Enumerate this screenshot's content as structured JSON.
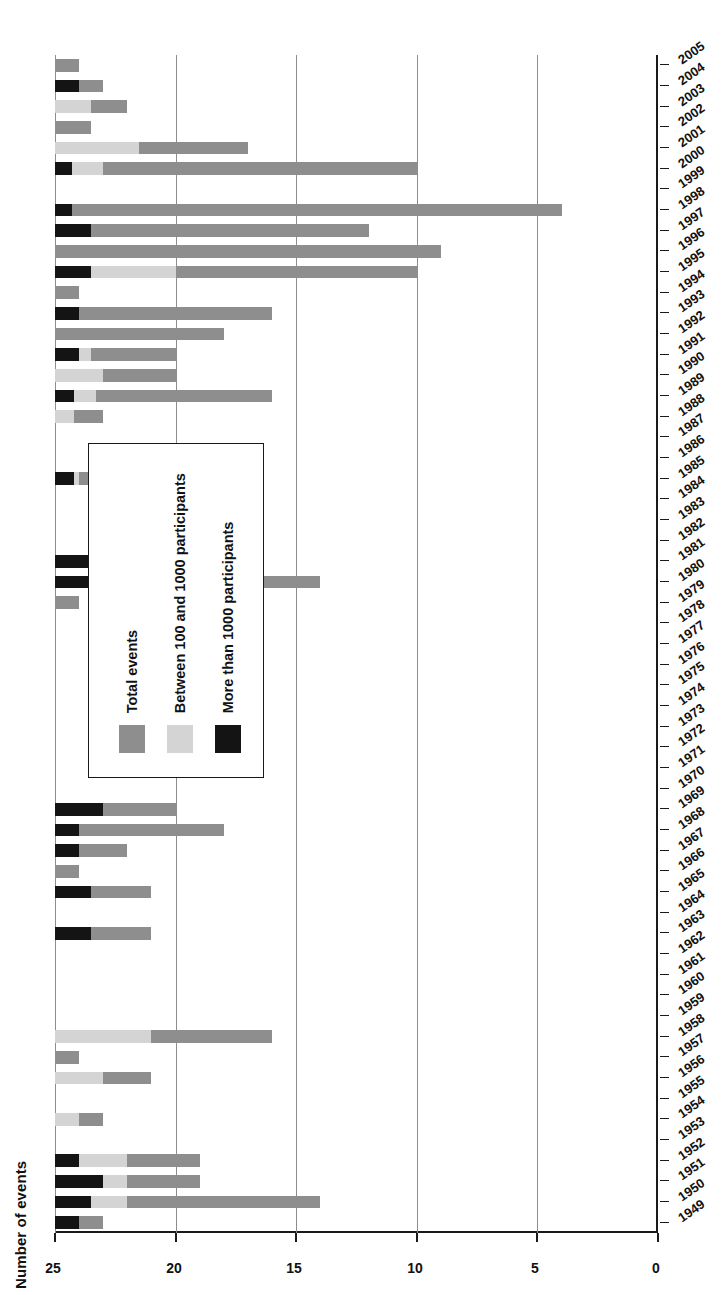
{
  "chart_data": {
    "type": "bar",
    "orientation": "horizontal-rotated",
    "title": "",
    "xlabel": "",
    "ylabel": "Number of events",
    "ylim": [
      0,
      25
    ],
    "ytick_labels": [
      "0",
      "5",
      "10",
      "15",
      "20",
      "25"
    ],
    "ytick_values": [
      0,
      5,
      10,
      15,
      20,
      25
    ],
    "grid": true,
    "legend_position": "inside-left",
    "categories": [
      "1949",
      "1950",
      "1951",
      "1952",
      "1953",
      "1954",
      "1955",
      "1956",
      "1957",
      "1958",
      "1959",
      "1960",
      "1961",
      "1962",
      "1963",
      "1964",
      "1965",
      "1966",
      "1967",
      "1968",
      "1969",
      "1970",
      "1971",
      "1972",
      "1973",
      "1974",
      "1975",
      "1976",
      "1977",
      "1978",
      "1979",
      "1980",
      "1981",
      "1982",
      "1983",
      "1984",
      "1985",
      "1986",
      "1987",
      "1988",
      "1989",
      "1990",
      "1991",
      "1992",
      "1993",
      "1994",
      "1995",
      "1996",
      "1997",
      "1998",
      "1999",
      "2000",
      "2001",
      "2002",
      "2003",
      "2004",
      "2005"
    ],
    "series": [
      {
        "name": "Total events",
        "color": "#8e8e8e",
        "values": [
          2,
          11,
          6,
          6,
          0,
          2,
          0,
          4,
          1,
          9,
          0,
          0,
          0,
          0,
          4,
          0,
          4,
          1,
          3,
          7,
          5,
          0,
          0,
          0,
          0,
          0,
          0,
          0,
          0,
          0,
          1,
          11,
          6,
          0,
          0,
          0,
          2,
          0,
          0,
          2,
          9,
          5,
          5,
          7,
          9,
          1,
          15,
          16,
          13,
          21,
          0,
          15,
          8,
          1.5,
          3,
          2,
          1
        ]
      },
      {
        "name": "Between 100 and 1000 participants",
        "color": "#d4d4d4",
        "values": [
          0,
          3,
          3,
          3,
          0,
          1,
          0,
          2,
          0,
          4,
          0,
          0,
          0,
          0,
          0,
          0,
          0,
          0,
          0,
          0,
          0,
          0,
          0,
          0,
          0,
          0,
          0,
          0,
          0,
          0,
          0,
          1,
          1.3,
          0,
          0,
          0,
          1,
          0,
          0,
          0.8,
          1.7,
          2,
          1.5,
          0,
          0,
          0,
          5,
          0,
          0,
          0,
          0,
          2,
          3.5,
          0,
          1.5,
          0,
          0
        ]
      },
      {
        "name": "More than 1000 participants",
        "color": "#141414",
        "values": [
          1,
          1.5,
          2,
          1,
          0,
          0,
          0,
          0,
          0,
          0,
          0,
          0,
          0,
          0,
          1.5,
          0,
          1.5,
          0,
          1,
          1,
          2,
          0,
          0,
          0,
          0,
          0,
          0,
          0,
          0,
          0,
          0,
          2,
          2,
          0,
          0,
          0,
          0.8,
          0,
          0,
          0,
          0.8,
          0,
          1,
          0,
          1,
          0,
          1.5,
          0,
          1.5,
          0.7,
          0,
          0.7,
          0,
          0,
          0,
          1,
          0
        ]
      }
    ],
    "legend": [
      {
        "label": "Total events",
        "color": "#8e8e8e"
      },
      {
        "label": "Between 100 and 1000 participants",
        "color": "#d4d4d4"
      },
      {
        "label": "More than 1000 participants",
        "color": "#141414"
      }
    ]
  }
}
